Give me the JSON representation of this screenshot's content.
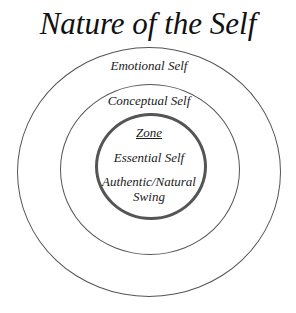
{
  "title": "Nature of the Self",
  "rings": {
    "outer": {
      "label": "Emotional Self"
    },
    "middle": {
      "label": "Conceptual Self"
    },
    "inner": {
      "heading": "Zone",
      "label": "Essential Self",
      "sublabel_line1": "Authentic/Natural",
      "sublabel_line2": "Swing"
    }
  },
  "colors": {
    "stroke": "#555555",
    "text": "#1a1a1a",
    "background": "#ffffff"
  }
}
